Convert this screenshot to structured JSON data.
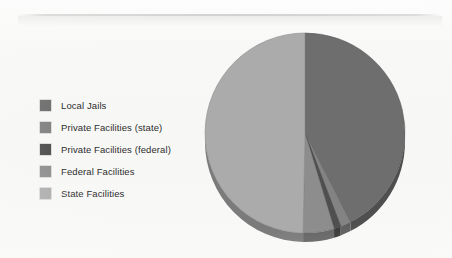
{
  "page": {
    "background_color": "#f8f8f7",
    "scan_artifact": true
  },
  "legend": {
    "position": "left",
    "items": [
      {
        "label": "Local Jails",
        "color": "#6e6e6e"
      },
      {
        "label": "Private Facilities (state)",
        "color": "#838383"
      },
      {
        "label": "Private Facilities (federal)",
        "color": "#4f4f4f"
      },
      {
        "label": "Federal Facilities",
        "color": "#8d8d8d"
      },
      {
        "label": "State Facilities",
        "color": "#ababab"
      }
    ]
  },
  "chart_data": {
    "type": "pie",
    "title": "",
    "subtitle": "",
    "xlabel": "",
    "ylabel": "",
    "legend_position": "left",
    "grid": false,
    "three_d": true,
    "start_angle_deg": 0,
    "direction": "clockwise",
    "categories": [
      "Local Jails",
      "Private Facilities (state)",
      "Private Facilities (federal)",
      "Federal Facilities",
      "State Facilities"
    ],
    "colors": [
      "#6e6e6e",
      "#838383",
      "#4f4f4f",
      "#8d8d8d",
      "#ababab"
    ],
    "values": [
      42.5,
      1.7,
      1.1,
      5.0,
      49.7
    ],
    "units": "percent",
    "angles_deg": [
      153.0,
      6.1,
      4.0,
      18.0,
      178.9
    ],
    "data_labels_shown": false
  }
}
